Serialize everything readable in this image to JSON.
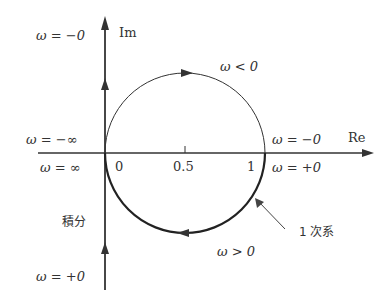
{
  "diagram": {
    "type": "nyquist-plot",
    "colors": {
      "stroke": "#333333",
      "text": "#333333",
      "background": "#ffffff"
    },
    "axes": {
      "real_label": "Re",
      "imag_label": "Im",
      "ticks": [
        "0",
        "0.5",
        "1"
      ]
    },
    "labels": {
      "omega_minus_zero_top": "ω = −0",
      "omega_minus_inf": "ω = −∞",
      "omega_inf": "ω = ∞",
      "omega_minus_zero_right": "ω = −0",
      "omega_plus_zero_right": "ω = +0",
      "omega_plus_zero_bottom": "ω = +0",
      "omega_lt_zero": "ω < 0",
      "omega_gt_zero": "ω > 0",
      "integral": "積分",
      "first_order": "1 次系"
    },
    "curves": [
      {
        "name": "first-order-system",
        "shape": "circle",
        "center": [
          0.5,
          0
        ],
        "radius": 0.5,
        "negative_freq_half": "upper (thin)",
        "positive_freq_half": "lower (thick)"
      },
      {
        "name": "integrator",
        "shape": "imaginary-axis",
        "direction": "upward from -j∞ to +j∞"
      }
    ]
  }
}
